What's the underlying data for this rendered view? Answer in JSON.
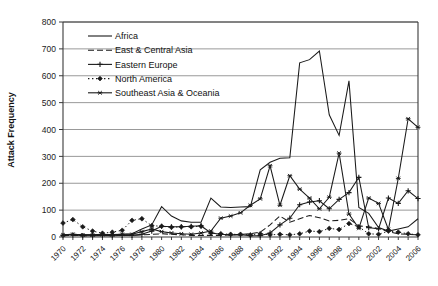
{
  "chart_data": {
    "type": "line",
    "title": "",
    "xlabel": "",
    "ylabel": "Attack Frequency",
    "ylim": [
      0,
      800
    ],
    "ytick_step": 100,
    "yticks": [
      0,
      100,
      200,
      300,
      400,
      500,
      600,
      700,
      800
    ],
    "xlim": [
      1970,
      2006
    ],
    "xticks": [
      1970,
      1972,
      1974,
      1976,
      1978,
      1980,
      1982,
      1984,
      1986,
      1988,
      1990,
      1992,
      1994,
      1996,
      1998,
      2000,
      2002,
      2004,
      2006
    ],
    "x": [
      1970,
      1971,
      1972,
      1973,
      1974,
      1975,
      1976,
      1977,
      1978,
      1979,
      1980,
      1981,
      1982,
      1983,
      1984,
      1985,
      1986,
      1987,
      1988,
      1989,
      1990,
      1991,
      1992,
      1993,
      1994,
      1995,
      1996,
      1997,
      1998,
      1999,
      2000,
      2001,
      2002,
      2003,
      2004,
      2005,
      2006
    ],
    "grid": true,
    "legend_position": "upper-left-inside",
    "series": [
      {
        "name": "Africa",
        "style": "solid",
        "marker": "none",
        "color": "#1a1a1a",
        "values": [
          8,
          10,
          8,
          8,
          10,
          8,
          10,
          12,
          30,
          45,
          113,
          78,
          60,
          55,
          55,
          145,
          112,
          110,
          112,
          113,
          250,
          278,
          293,
          295,
          648,
          660,
          692,
          455,
          378,
          581,
          110,
          88,
          35,
          22,
          30,
          38,
          68
        ]
      },
      {
        "name": "East & Central Asia",
        "style": "dashed",
        "marker": "none",
        "color": "#1a1a1a",
        "values": [
          5,
          6,
          5,
          5,
          6,
          5,
          6,
          6,
          8,
          10,
          12,
          10,
          8,
          6,
          6,
          6,
          6,
          8,
          10,
          12,
          18,
          45,
          78,
          55,
          68,
          80,
          72,
          60,
          62,
          68,
          42,
          38,
          32,
          20,
          12,
          10,
          8
        ]
      },
      {
        "name": "Eastern Europe",
        "style": "solid",
        "marker": "plus",
        "color": "#1a1a1a",
        "values": [
          5,
          8,
          5,
          5,
          6,
          5,
          6,
          6,
          10,
          22,
          40,
          38,
          38,
          40,
          42,
          15,
          10,
          8,
          8,
          5,
          5,
          15,
          45,
          70,
          120,
          130,
          135,
          105,
          140,
          165,
          222,
          35,
          30,
          145,
          125,
          172,
          143
        ]
      },
      {
        "name": "North America",
        "style": "dotted",
        "marker": "diamond",
        "color": "#1a1a1a",
        "values": [
          52,
          65,
          38,
          22,
          14,
          18,
          25,
          62,
          68,
          42,
          40,
          36,
          38,
          38,
          40,
          15,
          12,
          10,
          10,
          8,
          12,
          8,
          10,
          8,
          12,
          22,
          20,
          32,
          28,
          50,
          38,
          12,
          10,
          22,
          18,
          12,
          8
        ]
      },
      {
        "name": "Southeast Asia & Oceania",
        "style": "solid",
        "marker": "asterisk",
        "color": "#1a1a1a",
        "values": [
          8,
          10,
          8,
          8,
          9,
          9,
          10,
          10,
          20,
          30,
          20,
          15,
          12,
          10,
          15,
          22,
          70,
          78,
          90,
          118,
          142,
          265,
          118,
          228,
          178,
          145,
          105,
          148,
          312,
          85,
          32,
          145,
          125,
          28,
          218,
          440,
          408
        ]
      }
    ]
  },
  "legend": {
    "entries": [
      {
        "label": "Africa"
      },
      {
        "label": "East & Central Asia"
      },
      {
        "label": "Eastern Europe"
      },
      {
        "label": "North America"
      },
      {
        "label": "Southeast Asia & Oceania"
      }
    ]
  }
}
